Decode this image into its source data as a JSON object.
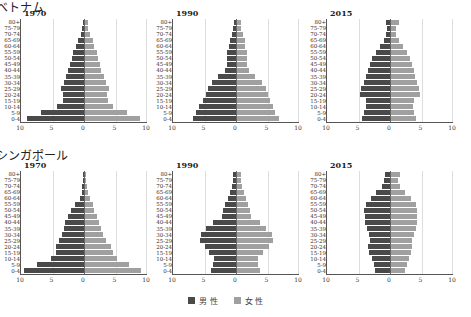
{
  "chart_data": [
    {
      "type": "bar",
      "subtype": "population-pyramid",
      "country": "ベトナム",
      "title": "1970",
      "categories": [
        "0-4",
        "5-9",
        "10-14",
        "15-19",
        "20-24",
        "25-29",
        "30-34",
        "35-39",
        "40-44",
        "45-49",
        "50-54",
        "55-59",
        "60-64",
        "65-69",
        "70-74",
        "75-79",
        "80+"
      ],
      "series": [
        {
          "name": "男 性",
          "values": [
            9.0,
            6.8,
            4.3,
            3.4,
            3.4,
            3.7,
            3.1,
            2.9,
            2.5,
            2.3,
            1.9,
            1.7,
            1.3,
            0.9,
            0.5,
            0.3,
            0.2
          ]
        },
        {
          "name": "女 性",
          "values": [
            8.7,
            6.6,
            4.4,
            3.6,
            3.5,
            3.8,
            3.3,
            3.0,
            2.5,
            2.4,
            2.0,
            1.9,
            1.5,
            1.2,
            0.8,
            0.5,
            0.4
          ]
        }
      ],
      "xticks": [
        "10",
        "5",
        "0",
        "5",
        "10"
      ],
      "xlim": [
        -10,
        10
      ]
    },
    {
      "type": "bar",
      "subtype": "population-pyramid",
      "country": "ベトナム",
      "title": "1990",
      "categories": [
        "0-4",
        "5-9",
        "10-14",
        "15-19",
        "20-24",
        "25-29",
        "30-34",
        "35-39",
        "40-44",
        "45-49",
        "50-54",
        "55-59",
        "60-64",
        "65-69",
        "70-74",
        "75-79",
        "80+"
      ],
      "series": [
        {
          "name": "男 性",
          "values": [
            6.9,
            6.3,
            5.8,
            5.3,
            4.8,
            4.4,
            3.8,
            2.8,
            1.7,
            1.4,
            1.4,
            1.4,
            1.1,
            0.9,
            0.6,
            0.4,
            0.3
          ]
        },
        {
          "name": "女 性",
          "values": [
            6.6,
            6.1,
            5.7,
            5.3,
            4.9,
            4.6,
            3.9,
            2.9,
            1.9,
            1.6,
            1.6,
            1.6,
            1.3,
            1.2,
            0.9,
            0.7,
            0.6
          ]
        }
      ],
      "xticks": [
        "10",
        "5",
        "0",
        "5",
        "10"
      ],
      "xlim": [
        -10,
        10
      ]
    },
    {
      "type": "bar",
      "subtype": "population-pyramid",
      "country": "ベトナム",
      "title": "2015",
      "categories": [
        "0-4",
        "5-9",
        "10-14",
        "15-19",
        "20-24",
        "25-29",
        "30-34",
        "35-39",
        "40-44",
        "45-49",
        "50-54",
        "55-59",
        "60-64",
        "65-69",
        "70-74",
        "75-79",
        "80+"
      ],
      "series": [
        {
          "name": "男 性",
          "values": [
            4.5,
            4.1,
            3.8,
            3.8,
            4.8,
            4.6,
            4.2,
            3.8,
            3.5,
            3.2,
            2.8,
            2.3,
            1.6,
            0.9,
            0.6,
            0.5,
            0.6
          ]
        },
        {
          "name": "女 性",
          "values": [
            4.0,
            3.7,
            3.5,
            3.7,
            4.6,
            4.5,
            4.2,
            3.8,
            3.6,
            3.3,
            3.0,
            2.6,
            1.9,
            1.2,
            0.8,
            0.8,
            1.3
          ]
        }
      ],
      "xticks": [
        "10",
        "5",
        "0",
        "5",
        "10"
      ],
      "xlim": [
        -10,
        10
      ]
    },
    {
      "type": "bar",
      "subtype": "population-pyramid",
      "country": "シンガポール",
      "title": "1970",
      "categories": [
        "0-4",
        "5-9",
        "10-14",
        "15-19",
        "20-24",
        "25-29",
        "30-34",
        "35-39",
        "40-44",
        "45-49",
        "50-54",
        "55-59",
        "60-64",
        "65-69",
        "70-74",
        "75-79",
        "80+"
      ],
      "series": [
        {
          "name": "男 性",
          "values": [
            9.5,
            7.4,
            5.3,
            4.5,
            4.4,
            4.0,
            3.5,
            3.1,
            3.0,
            2.6,
            2.0,
            1.4,
            0.7,
            0.3,
            0.3,
            0.2,
            0.1
          ]
        },
        {
          "name": "女 性",
          "values": [
            8.9,
            7.0,
            5.0,
            4.5,
            4.1,
            3.4,
            2.8,
            2.5,
            2.3,
            1.9,
            1.5,
            1.2,
            0.8,
            0.5,
            0.3,
            0.2,
            0.1
          ]
        }
      ],
      "xticks": [
        "10",
        "5",
        "0",
        "5",
        "10"
      ],
      "xlim": [
        -10,
        10
      ]
    },
    {
      "type": "bar",
      "subtype": "population-pyramid",
      "country": "シンガポール",
      "title": "1990",
      "categories": [
        "0-4",
        "5-9",
        "10-14",
        "15-19",
        "20-24",
        "25-29",
        "30-34",
        "35-39",
        "40-44",
        "45-49",
        "50-54",
        "55-59",
        "60-64",
        "65-69",
        "70-74",
        "75-79",
        "80+"
      ],
      "series": [
        {
          "name": "男 性",
          "values": [
            3.9,
            3.6,
            3.5,
            4.3,
            5.0,
            5.7,
            5.6,
            4.7,
            3.7,
            2.3,
            2.0,
            1.7,
            1.3,
            0.9,
            0.7,
            0.5,
            0.4
          ]
        },
        {
          "name": "女 性",
          "values": [
            3.7,
            3.4,
            3.4,
            4.1,
            5.0,
            5.7,
            5.6,
            4.6,
            3.6,
            2.2,
            2.0,
            1.7,
            1.4,
            1.1,
            0.8,
            0.6,
            0.6
          ]
        }
      ],
      "xticks": [
        "10",
        "5",
        "0",
        "5",
        "10"
      ],
      "xlim": [
        -10,
        10
      ]
    },
    {
      "type": "bar",
      "subtype": "population-pyramid",
      "country": "シンガポール",
      "title": "2015",
      "categories": [
        "0-4",
        "5-9",
        "10-14",
        "15-19",
        "20-24",
        "25-29",
        "30-34",
        "35-39",
        "40-44",
        "45-49",
        "50-54",
        "55-59",
        "60-64",
        "65-69",
        "70-74",
        "75-79",
        "80+"
      ],
      "series": [
        {
          "name": "男 性",
          "values": [
            2.4,
            2.5,
            2.8,
            3.3,
            3.5,
            3.2,
            3.4,
            3.7,
            3.9,
            4.0,
            4.1,
            3.8,
            3.0,
            2.2,
            1.2,
            0.9,
            0.8
          ]
        },
        {
          "name": "女 性",
          "values": [
            2.3,
            2.5,
            2.8,
            3.1,
            3.4,
            3.3,
            3.6,
            4.0,
            4.2,
            4.1,
            4.1,
            3.9,
            3.1,
            2.3,
            1.4,
            1.1,
            1.4
          ]
        }
      ],
      "xticks": [
        "10",
        "5",
        "0",
        "5",
        "10"
      ],
      "xlim": [
        -10,
        10
      ]
    }
  ],
  "countries": [
    "ベトナム",
    "シンガポール"
  ],
  "legend": {
    "male": {
      "label": "男 性",
      "color": "#4a4a4a"
    },
    "female": {
      "label": "女 性",
      "color": "#a0a0a0"
    }
  }
}
